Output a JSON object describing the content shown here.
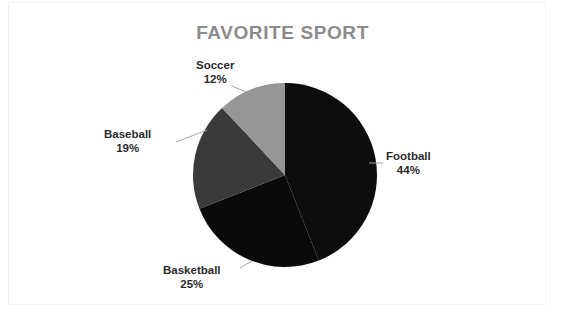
{
  "chart_data": {
    "type": "pie",
    "title": "FAVORITE SPORT",
    "categories": [
      "Football",
      "Basketball",
      "Baseball",
      "Soccer"
    ],
    "values": [
      44,
      25,
      19,
      12
    ],
    "value_labels": [
      "44%",
      "25%",
      "19%",
      "12%"
    ],
    "unit": "percent",
    "legend": "none",
    "labels_position": "outside",
    "leader_lines": true,
    "start_angle_deg": 0,
    "direction": "clockwise",
    "colors": [
      "#0d0d0d",
      "#0a0a0a",
      "#3a3a3a",
      "#969696"
    ],
    "title_color": "#8c8c8c",
    "label_color": "#2b2b2b",
    "background": "#ffffff"
  },
  "chart": {
    "title": "FAVORITE SPORT",
    "slices": [
      {
        "name": "Football",
        "percent_label": "44%",
        "value": 44,
        "color": "#0d0d0d"
      },
      {
        "name": "Basketball",
        "percent_label": "25%",
        "value": 25,
        "color": "#0a0a0a"
      },
      {
        "name": "Baseball",
        "percent_label": "19%",
        "value": 19,
        "color": "#3a3a3a"
      },
      {
        "name": "Soccer",
        "percent_label": "12%",
        "value": 12,
        "color": "#969696"
      }
    ]
  }
}
